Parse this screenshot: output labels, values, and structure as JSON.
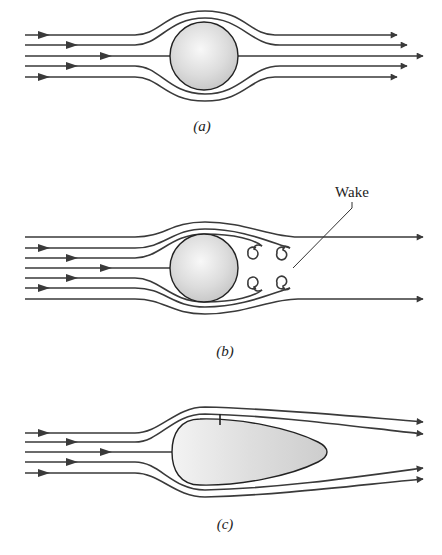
{
  "figure": {
    "panels": [
      {
        "id": "a",
        "label": "(a)",
        "description": "Streamline flow around a sphere (ideal, no separation)"
      },
      {
        "id": "b",
        "label": "(b)",
        "description": "Flow around a sphere with separation and wake eddies",
        "annotation": "Wake"
      },
      {
        "id": "c",
        "label": "(c)",
        "description": "Streamline flow around a streamlined (teardrop) body"
      }
    ],
    "colors": {
      "stroke": "#3a3a3a",
      "body_fill_light": "#f4f4f4",
      "body_fill_dark": "#c8c8c8",
      "background": "#ffffff"
    }
  }
}
